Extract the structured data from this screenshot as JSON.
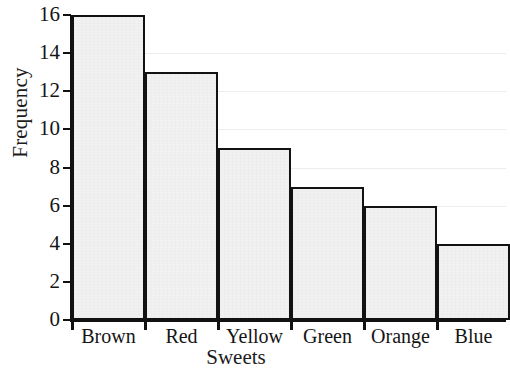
{
  "chart_data": {
    "type": "bar",
    "title": "",
    "xlabel": "Sweets",
    "ylabel": "Frequency",
    "categories": [
      "Brown",
      "Red",
      "Yellow",
      "Green",
      "Orange",
      "Blue"
    ],
    "values": [
      16,
      13,
      9,
      7,
      6,
      4
    ],
    "ylim": [
      0,
      16
    ],
    "xlim_note": "categorical, 6 contiguous bars (histogram style, no gaps)",
    "y_ticks": [
      0,
      2,
      4,
      6,
      8,
      10,
      12,
      14,
      16
    ],
    "y_tick_labels": [
      "0",
      "2",
      "4",
      "6",
      "8",
      "10",
      "12",
      "14",
      "16"
    ],
    "grid": "horizontal gridlines at even y values, very faint",
    "legend": "none",
    "bar_fill_color": "#f1f1f1",
    "bar_edge_color": "#121212",
    "gridline_color": "#ededed",
    "axis_color": "#111111",
    "background_color": "#ffffff"
  },
  "figure": {
    "y_axis_title": "Frequency",
    "x_axis_title": "Sweets"
  }
}
